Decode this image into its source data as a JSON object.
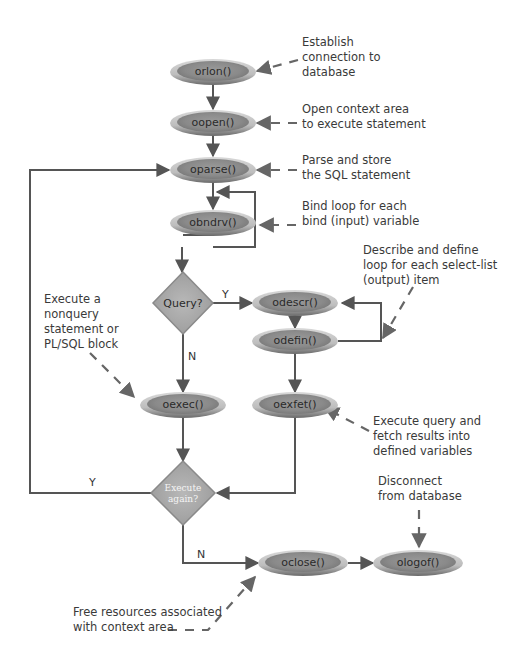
{
  "diagram": {
    "type": "flowchart",
    "colors": {
      "ellipse_outer": "#c8c8c8",
      "ellipse_inner": "#8e8e8e",
      "diamond_fill": "#a8a8a8",
      "line": "#555555",
      "text": "#333333"
    },
    "nodes": [
      {
        "id": "orlon",
        "label": "orlon()",
        "shape": "ellipse"
      },
      {
        "id": "oopen",
        "label": "oopen()",
        "shape": "ellipse"
      },
      {
        "id": "oparse",
        "label": "oparse()",
        "shape": "ellipse"
      },
      {
        "id": "obndrv",
        "label": "obndrv()",
        "shape": "ellipse"
      },
      {
        "id": "query",
        "label": "Query?",
        "shape": "diamond"
      },
      {
        "id": "odescr",
        "label": "odescr()",
        "shape": "ellipse"
      },
      {
        "id": "odefin",
        "label": "odefin()",
        "shape": "ellipse"
      },
      {
        "id": "oexec",
        "label": "oexec()",
        "shape": "ellipse"
      },
      {
        "id": "oexfet",
        "label": "oexfet()",
        "shape": "ellipse"
      },
      {
        "id": "again",
        "label_line1": "Execute",
        "label_line2": "again?",
        "shape": "diamond"
      },
      {
        "id": "oclose",
        "label": "oclose()",
        "shape": "ellipse"
      },
      {
        "id": "ologof",
        "label": "ologof()",
        "shape": "ellipse"
      }
    ],
    "edge_labels": {
      "query_yes": "Y",
      "query_no": "N",
      "again_yes": "Y",
      "again_no": "N"
    },
    "annotations": {
      "orlon": [
        "Establish",
        "connection to",
        "database"
      ],
      "oopen": [
        "Open context area",
        "to execute statement"
      ],
      "oparse": [
        "Parse and store",
        "the SQL statement"
      ],
      "obndrv": [
        "Bind loop for each",
        "bind (input) variable"
      ],
      "odefin": [
        "Describe and define",
        "loop for each select-list",
        "(output) item"
      ],
      "oexec": [
        "Execute a",
        "nonquery",
        "statement or",
        "PL/SQL block"
      ],
      "oexfet": [
        "Execute query and",
        "fetch results into",
        "defined variables"
      ],
      "ologof": [
        "Disconnect",
        "from database"
      ],
      "oclose": [
        "Free resources associated",
        "with context area"
      ]
    }
  }
}
